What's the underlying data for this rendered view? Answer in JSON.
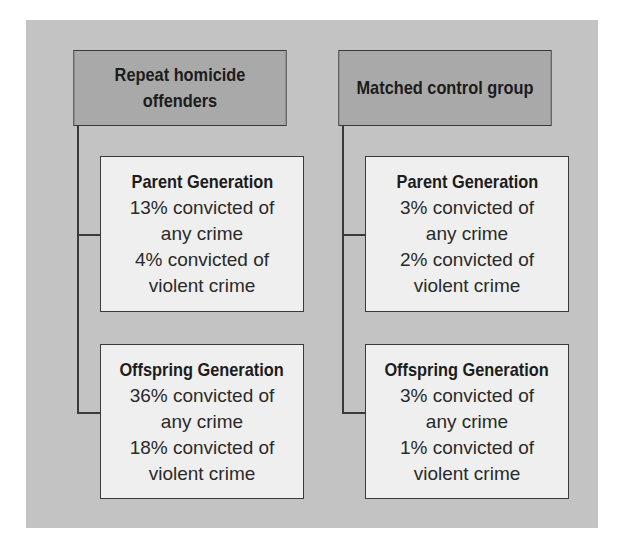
{
  "diagram": {
    "colors": {
      "panel_bg": "#c3c3c3",
      "header_bg": "#a9a9a9",
      "box_bg": "#efefef",
      "border": "#3a3a3a"
    },
    "groups": [
      {
        "header": "Repeat homicide offenders",
        "header_lines": [
          "Repeat homicide",
          "offenders"
        ],
        "children": [
          {
            "title": "Parent Generation",
            "lines": [
              "13% convicted of",
              "any crime",
              "4% convicted of",
              "violent crime"
            ]
          },
          {
            "title": "Offspring Generation",
            "lines": [
              "36% convicted of",
              "any crime",
              "18% convicted of",
              "violent crime"
            ]
          }
        ]
      },
      {
        "header": "Matched control group",
        "header_lines": [
          "Matched control group"
        ],
        "children": [
          {
            "title": "Parent Generation",
            "lines": [
              "3% convicted of",
              "any crime",
              "2% convicted of",
              "violent crime"
            ]
          },
          {
            "title": "Offspring Generation",
            "lines": [
              "3% convicted of",
              "any crime",
              "1% convicted of",
              "violent crime"
            ]
          }
        ]
      }
    ]
  }
}
